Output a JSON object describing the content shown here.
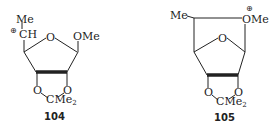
{
  "structures": [
    {
      "id": "104",
      "label": "104",
      "atoms": {
        "top_methyl": "Me",
        "carbocation": "CH",
        "charge": "⊕",
        "ring_oxygen": "O",
        "anomeric_substituent": "OMe",
        "acetal_o1": "O",
        "acetal_o2": "O",
        "acetal_carbon": "CMe",
        "acetal_carbon_sub": "2"
      }
    },
    {
      "id": "105",
      "label": "105",
      "atoms": {
        "top_methyl": "Me",
        "oxonium": "OMe",
        "charge": "⊕",
        "ring_oxygen": "O",
        "acetal_o1": "O",
        "acetal_o2": "O",
        "acetal_carbon": "CMe",
        "acetal_carbon_sub": "2"
      }
    }
  ]
}
